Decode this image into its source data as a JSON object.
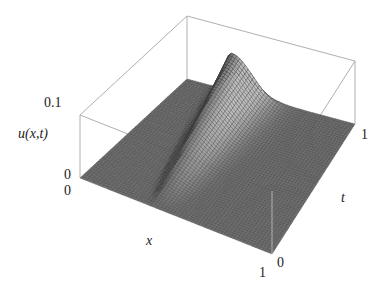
{
  "chart_data": {
    "type": "surface3d",
    "title": "",
    "xlabel": "x",
    "ylabel": "t",
    "zlabel": "u(x,t)",
    "xlim": [
      0,
      1
    ],
    "ylim": [
      0,
      1
    ],
    "zlim": [
      0,
      0.1
    ],
    "x_ticks": [
      "0",
      "1"
    ],
    "t_ticks": [
      "0",
      "1"
    ],
    "z_ticks": [
      "0",
      "0.1"
    ],
    "grid": false,
    "box": true,
    "surface_color": "#6e6e6e",
    "mesh_color": "#3a3a3a",
    "peak": {
      "x": 0.3,
      "t": 0.95,
      "u": 0.07
    }
  },
  "labels": {
    "z_max": "0.1",
    "z_min": "0",
    "x_min": "0",
    "x_max": "1",
    "t_min": "0",
    "t_max": "1",
    "z_axis": "u(x,t)",
    "x_axis": "x",
    "t_axis": "t"
  }
}
